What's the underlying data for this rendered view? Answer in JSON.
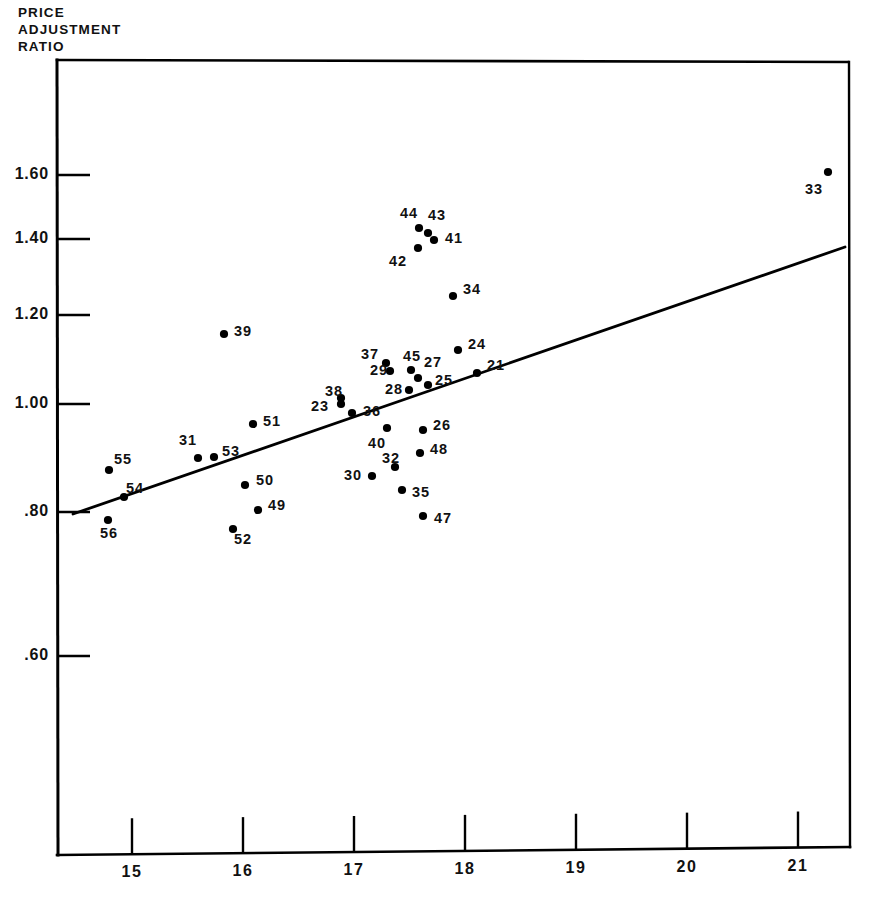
{
  "figure": {
    "y_axis_title": "PRICE\nADJUSTMENT\nRATIO",
    "background_color": "#ffffff",
    "ink_color": "#000000"
  },
  "axes": {
    "y_ticks": [
      {
        "label": "1.60",
        "value": 1.6,
        "py": 175
      },
      {
        "label": "1.40",
        "value": 1.4,
        "py": 239
      },
      {
        "label": "1.20",
        "value": 1.2,
        "py": 315
      },
      {
        "label": "1.00",
        "value": 1.0,
        "py": 404
      },
      {
        "label": ".80",
        "value": 0.8,
        "py": 512
      },
      {
        "label": ".60",
        "value": 0.6,
        "py": 656
      }
    ],
    "x_ticks": [
      {
        "label": "15",
        "value": 15,
        "px": 132
      },
      {
        "label": "16",
        "value": 16,
        "px": 243
      },
      {
        "label": "17",
        "value": 17,
        "px": 354
      },
      {
        "label": "18",
        "value": 18,
        "px": 465
      },
      {
        "label": "19",
        "value": 19,
        "px": 576
      },
      {
        "label": "20",
        "value": 20,
        "px": 687
      },
      {
        "label": "21",
        "value": 21,
        "px": 798
      }
    ],
    "frame": {
      "left": 57,
      "right": 848,
      "top": 60,
      "bottom": 855
    }
  },
  "chart_data": {
    "type": "scatter",
    "title": "",
    "xlabel": "",
    "ylabel": "PRICE ADJUSTMENT RATIO",
    "xlim": [
      14.3,
      21.4
    ],
    "ylim": [
      0.52,
      1.8
    ],
    "yscale": "log",
    "grid": false,
    "legend": null,
    "points": [
      {
        "label": "21",
        "x": 18.1,
        "y": 1.055,
        "px": 477,
        "py": 373,
        "lx": 487,
        "ly": 366
      },
      {
        "label": "23",
        "x": 16.72,
        "y": 1.0,
        "px": 341,
        "py": 404,
        "lx": 311,
        "ly": 407
      },
      {
        "label": "24",
        "x": 17.92,
        "y": 1.105,
        "px": 458,
        "py": 350,
        "lx": 468,
        "ly": 345
      },
      {
        "label": "25",
        "x": 17.65,
        "y": 1.03,
        "px": 428,
        "py": 385,
        "lx": 435,
        "ly": 381
      },
      {
        "label": "26",
        "x": 17.75,
        "y": 0.945,
        "px": 423,
        "py": 430,
        "lx": 433,
        "ly": 426
      },
      {
        "label": "27",
        "x": 17.55,
        "y": 1.055,
        "px": 418,
        "py": 378,
        "lx": 424,
        "ly": 363
      },
      {
        "label": "28",
        "x": 17.45,
        "y": 1.015,
        "px": 409,
        "py": 390,
        "lx": 385,
        "ly": 390
      },
      {
        "label": "29",
        "x": 17.3,
        "y": 1.06,
        "px": 390,
        "py": 371,
        "lx": 370,
        "ly": 371
      },
      {
        "label": "30",
        "x": 17.15,
        "y": 0.87,
        "px": 372,
        "py": 476,
        "lx": 344,
        "ly": 476
      },
      {
        "label": "31",
        "x": 15.65,
        "y": 0.92,
        "px": 198,
        "py": 458,
        "lx": 179,
        "ly": 441
      },
      {
        "label": "32",
        "x": 17.35,
        "y": 0.885,
        "px": 395,
        "py": 467,
        "lx": 382,
        "ly": 459
      },
      {
        "label": "33",
        "x": 21.25,
        "y": 1.6,
        "px": 828,
        "py": 172,
        "lx": 805,
        "ly": 190
      },
      {
        "label": "34",
        "x": 17.85,
        "y": 1.24,
        "px": 453,
        "py": 296,
        "lx": 463,
        "ly": 290
      },
      {
        "label": "35",
        "x": 17.45,
        "y": 0.845,
        "px": 402,
        "py": 490,
        "lx": 412,
        "ly": 493
      },
      {
        "label": "36",
        "x": 17.05,
        "y": 0.985,
        "px": 352,
        "py": 413,
        "lx": 363,
        "ly": 412
      },
      {
        "label": "37",
        "x": 17.25,
        "y": 1.08,
        "px": 386,
        "py": 363,
        "lx": 361,
        "ly": 355
      },
      {
        "label": "38",
        "x": 16.75,
        "y": 1.005,
        "px": 341,
        "py": 398,
        "lx": 325,
        "ly": 392
      },
      {
        "label": "39",
        "x": 16.12,
        "y": 1.155,
        "px": 224,
        "py": 334,
        "lx": 234,
        "ly": 332
      },
      {
        "label": "40",
        "x": 17.3,
        "y": 0.955,
        "px": 387,
        "py": 428,
        "lx": 368,
        "ly": 444
      },
      {
        "label": "41",
        "x": 17.65,
        "y": 1.39,
        "px": 434,
        "py": 240,
        "lx": 445,
        "ly": 239
      },
      {
        "label": "42",
        "x": 17.52,
        "y": 1.36,
        "px": 418,
        "py": 248,
        "lx": 389,
        "ly": 262
      },
      {
        "label": "43",
        "x": 17.6,
        "y": 1.425,
        "px": 428,
        "py": 233,
        "lx": 428,
        "ly": 216
      },
      {
        "label": "44",
        "x": 17.52,
        "y": 1.44,
        "px": 419,
        "py": 228,
        "lx": 400,
        "ly": 214
      },
      {
        "label": "45",
        "x": 17.46,
        "y": 1.065,
        "px": 411,
        "py": 370,
        "lx": 403,
        "ly": 357
      },
      {
        "label": "47",
        "x": 17.72,
        "y": 0.8,
        "px": 423,
        "py": 516,
        "lx": 434,
        "ly": 519
      },
      {
        "label": "48",
        "x": 17.73,
        "y": 0.91,
        "px": 420,
        "py": 453,
        "lx": 430,
        "ly": 450
      },
      {
        "label": "49",
        "x": 16.15,
        "y": 0.825,
        "px": 258,
        "py": 510,
        "lx": 268,
        "ly": 506
      },
      {
        "label": "50",
        "x": 16.08,
        "y": 0.855,
        "px": 245,
        "py": 485,
        "lx": 256,
        "ly": 481
      },
      {
        "label": "51",
        "x": 16.17,
        "y": 0.96,
        "px": 253,
        "py": 424,
        "lx": 263,
        "ly": 422
      },
      {
        "label": "52",
        "x": 15.95,
        "y": 0.785,
        "px": 233,
        "py": 529,
        "lx": 234,
        "ly": 540
      },
      {
        "label": "53",
        "x": 15.8,
        "y": 0.92,
        "px": 214,
        "py": 457,
        "lx": 222,
        "ly": 452
      },
      {
        "label": "54",
        "x": 14.95,
        "y": 0.845,
        "px": 124,
        "py": 497,
        "lx": 126,
        "ly": 489
      },
      {
        "label": "55",
        "x": 14.82,
        "y": 0.875,
        "px": 109,
        "py": 470,
        "lx": 114,
        "ly": 460
      },
      {
        "label": "56",
        "x": 14.8,
        "y": 0.795,
        "px": 108,
        "py": 520,
        "lx": 100,
        "ly": 534
      }
    ],
    "regression_line": {
      "x_start": 14.73,
      "y_start": 0.8,
      "x_end": 21.4,
      "y_end": 1.37,
      "px_start": 73,
      "py_start": 514,
      "px_end": 845,
      "py_end": 247
    }
  }
}
